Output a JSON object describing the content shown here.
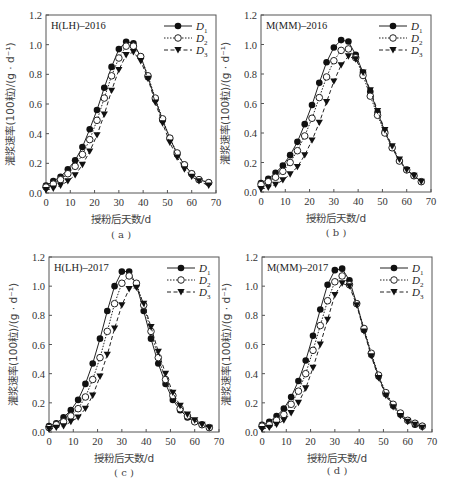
{
  "figure": {
    "x_label": "授粉后天数/d",
    "y_label": "灌浆速率(100粒)/(g · d⁻¹)",
    "legend": [
      {
        "name": "D",
        "sub": "1",
        "marker": "filled-circle",
        "line": "solid"
      },
      {
        "name": "D",
        "sub": "2",
        "marker": "open-circle",
        "line": "dotted"
      },
      {
        "name": "D",
        "sub": "3",
        "marker": "filled-triangle-down",
        "line": "dashed"
      }
    ],
    "x_ticks": [
      "0",
      "10",
      "20",
      "30",
      "40",
      "50",
      "60",
      "70"
    ],
    "y_ticks": [
      "0.0",
      "0.2",
      "0.4",
      "0.6",
      "0.8",
      "1.0",
      "1.2"
    ]
  },
  "chart_data": [
    {
      "type": "line",
      "panel": "(a)",
      "title": "H(LH)–2016",
      "xlabel": "授粉后天数/d",
      "ylabel": "灌浆速率(100粒)/(g · d⁻¹)",
      "xlim": [
        0,
        70
      ],
      "ylim": [
        0,
        1.2
      ],
      "x": [
        0,
        3,
        6,
        9,
        12,
        15,
        18,
        21,
        24,
        27,
        30,
        33,
        36,
        39,
        42,
        45,
        48,
        51,
        54,
        57,
        60,
        63,
        67
      ],
      "series": [
        {
          "name": "D1",
          "values": [
            0.05,
            0.08,
            0.11,
            0.16,
            0.22,
            0.31,
            0.43,
            0.56,
            0.71,
            0.85,
            0.97,
            1.02,
            1.01,
            0.92,
            0.78,
            0.63,
            0.49,
            0.37,
            0.26,
            0.19,
            0.13,
            0.09,
            0.07
          ]
        },
        {
          "name": "D2",
          "values": [
            0.04,
            0.06,
            0.09,
            0.13,
            0.18,
            0.26,
            0.36,
            0.49,
            0.64,
            0.79,
            0.91,
            0.99,
            0.99,
            0.92,
            0.79,
            0.64,
            0.5,
            0.37,
            0.27,
            0.19,
            0.13,
            0.09,
            0.07
          ]
        },
        {
          "name": "D3",
          "values": [
            0.02,
            0.03,
            0.05,
            0.08,
            0.12,
            0.19,
            0.28,
            0.39,
            0.53,
            0.69,
            0.83,
            0.93,
            0.95,
            0.89,
            0.77,
            0.61,
            0.47,
            0.34,
            0.24,
            0.16,
            0.11,
            0.08,
            0.05
          ]
        }
      ]
    },
    {
      "type": "line",
      "panel": "(b)",
      "title": "M(MM)–2016",
      "xlabel": "授粉后天数/d",
      "ylabel": "灌浆速率(100粒)/(g · d⁻¹)",
      "xlim": [
        0,
        70
      ],
      "ylim": [
        0,
        1.2
      ],
      "x": [
        0,
        3,
        6,
        9,
        12,
        15,
        18,
        21,
        24,
        27,
        30,
        33,
        36,
        39,
        42,
        45,
        48,
        51,
        54,
        57,
        60,
        63,
        66
      ],
      "series": [
        {
          "name": "D1",
          "values": [
            0.06,
            0.09,
            0.13,
            0.18,
            0.25,
            0.34,
            0.46,
            0.59,
            0.74,
            0.88,
            0.98,
            1.03,
            1.02,
            0.93,
            0.81,
            0.68,
            0.54,
            0.41,
            0.3,
            0.21,
            0.15,
            0.11,
            0.07
          ]
        },
        {
          "name": "D2",
          "values": [
            0.05,
            0.07,
            0.1,
            0.14,
            0.2,
            0.28,
            0.38,
            0.5,
            0.64,
            0.78,
            0.89,
            0.96,
            0.97,
            0.91,
            0.79,
            0.65,
            0.52,
            0.4,
            0.3,
            0.21,
            0.15,
            0.11,
            0.07
          ]
        },
        {
          "name": "D3",
          "values": [
            0.02,
            0.03,
            0.05,
            0.08,
            0.12,
            0.17,
            0.25,
            0.35,
            0.47,
            0.61,
            0.75,
            0.86,
            0.92,
            0.9,
            0.81,
            0.69,
            0.55,
            0.42,
            0.31,
            0.22,
            0.15,
            0.11,
            0.07
          ]
        }
      ]
    },
    {
      "type": "line",
      "panel": "(c)",
      "title": "H(LH)–2017",
      "xlabel": "授粉后天数/d",
      "ylabel": "灌浆速率(100粒)/(g · d⁻¹)",
      "xlim": [
        0,
        70
      ],
      "ylim": [
        0,
        1.2
      ],
      "x": [
        0,
        3,
        6,
        9,
        12,
        15,
        18,
        21,
        24,
        27,
        30,
        33,
        36,
        39,
        42,
        45,
        48,
        51,
        54,
        57,
        60,
        63,
        66
      ],
      "series": [
        {
          "name": "D1",
          "values": [
            0.04,
            0.06,
            0.1,
            0.15,
            0.22,
            0.33,
            0.47,
            0.64,
            0.83,
            1.0,
            1.1,
            1.1,
            1.01,
            0.83,
            0.64,
            0.47,
            0.33,
            0.22,
            0.15,
            0.1,
            0.07,
            0.05,
            0.03
          ]
        },
        {
          "name": "D2",
          "values": [
            0.03,
            0.05,
            0.07,
            0.11,
            0.16,
            0.24,
            0.36,
            0.51,
            0.69,
            0.88,
            1.02,
            1.07,
            1.02,
            0.87,
            0.69,
            0.51,
            0.36,
            0.25,
            0.16,
            0.11,
            0.07,
            0.05,
            0.03
          ]
        },
        {
          "name": "D3",
          "values": [
            0.02,
            0.03,
            0.04,
            0.07,
            0.1,
            0.16,
            0.25,
            0.38,
            0.53,
            0.71,
            0.87,
            0.98,
            0.99,
            0.88,
            0.72,
            0.55,
            0.4,
            0.27,
            0.18,
            0.12,
            0.08,
            0.05,
            0.03
          ]
        }
      ]
    },
    {
      "type": "line",
      "panel": "(d)",
      "title": "M(MM)–2017",
      "xlabel": "授粉后天数/d",
      "ylabel": "灌浆速率(100粒)/(g · d⁻¹)",
      "xlim": [
        0,
        70
      ],
      "ylim": [
        0,
        1.2
      ],
      "x": [
        0,
        3,
        6,
        9,
        12,
        15,
        18,
        21,
        24,
        27,
        30,
        33,
        36,
        39,
        42,
        45,
        48,
        51,
        54,
        57,
        60,
        63,
        66
      ],
      "series": [
        {
          "name": "D1",
          "values": [
            0.05,
            0.07,
            0.11,
            0.16,
            0.24,
            0.35,
            0.49,
            0.66,
            0.84,
            1.01,
            1.11,
            1.12,
            1.04,
            0.88,
            0.7,
            0.53,
            0.38,
            0.26,
            0.18,
            0.12,
            0.08,
            0.05,
            0.04
          ]
        },
        {
          "name": "D2",
          "values": [
            0.04,
            0.05,
            0.08,
            0.12,
            0.19,
            0.28,
            0.4,
            0.56,
            0.73,
            0.9,
            1.03,
            1.07,
            1.01,
            0.88,
            0.71,
            0.54,
            0.39,
            0.27,
            0.19,
            0.13,
            0.08,
            0.06,
            0.04
          ]
        },
        {
          "name": "D3",
          "values": [
            0.02,
            0.03,
            0.05,
            0.08,
            0.13,
            0.2,
            0.3,
            0.44,
            0.6,
            0.77,
            0.94,
            1.02,
            1.0,
            0.87,
            0.69,
            0.52,
            0.37,
            0.25,
            0.17,
            0.11,
            0.07,
            0.05,
            0.03
          ]
        }
      ]
    }
  ]
}
